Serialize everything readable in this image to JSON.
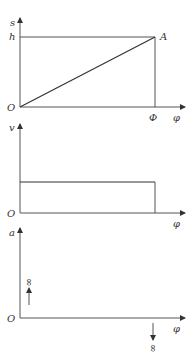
{
  "diagram": {
    "type": "cam-motion-curves",
    "graphs": [
      {
        "name": "displacement",
        "y_label": "s",
        "x_label": "φ",
        "origin_label": "O",
        "level_label": "h",
        "point_label": "A",
        "end_label": "Φ",
        "curve": "linear from O to A"
      },
      {
        "name": "velocity",
        "y_label": "v",
        "x_label": "φ",
        "origin_label": "O",
        "curve": "constant until Φ"
      },
      {
        "name": "acceleration",
        "y_label": "a",
        "x_label": "φ",
        "origin_label": "O",
        "impulse_start_label": "∞",
        "impulse_end_label": "∞",
        "curve": "zero with +∞ impulse at start, −∞ impulse at end"
      }
    ]
  },
  "colors": {
    "line": "#333333",
    "background": "#ffffff"
  }
}
